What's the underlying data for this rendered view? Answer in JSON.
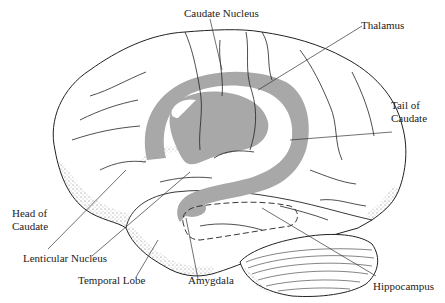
{
  "diagram": {
    "colors": {
      "background": "#ffffff",
      "ink": "#222222",
      "caudate_shading": "#a8a8a8"
    },
    "labels": {
      "caudate_nucleus": "Caudate Nucleus",
      "thalamus": "Thalamus",
      "tail_of_caudate_line1": "Tail of",
      "tail_of_caudate_line2": "Caudate",
      "head_of_caudate_line1": "Head of",
      "head_of_caudate_line2": "Caudate",
      "lenticular_nucleus": "Lenticular Nucleus",
      "temporal_lobe": "Temporal Lobe",
      "amygdala": "Amygdala",
      "hippocampus": "Hippocampus"
    }
  }
}
